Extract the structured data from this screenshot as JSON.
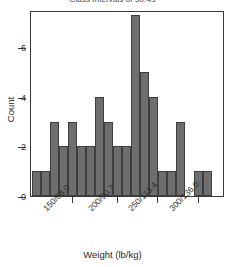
{
  "chart_data": {
    "type": "bar",
    "title": "Class Intervals of 30.43",
    "xlabel": "Weight (lb/kg)",
    "ylabel": "Count",
    "grid": false,
    "legend": null,
    "ylim": [
      0,
      7.5
    ],
    "yticks": [
      0,
      2,
      4,
      6
    ],
    "ytick_labels": [
      "0",
      "2",
      "4",
      "6"
    ],
    "xtick_labels": [
      "150/68.0",
      "200/90.7",
      "250/113.4",
      "300/136.0"
    ],
    "xtick_positions": [
      72,
      117,
      157,
      198
    ],
    "bar_width_px": 9,
    "bar_start_px": 31,
    "categories": [
      "b1",
      "b2",
      "b3",
      "b4",
      "b5",
      "b6",
      "b7",
      "b8",
      "b9",
      "b10",
      "b11",
      "b12",
      "b13",
      "b14",
      "b15",
      "b16",
      "b17",
      "b18",
      "b19",
      "b20"
    ],
    "values": [
      1,
      1,
      3,
      2,
      3,
      2,
      2,
      4,
      3,
      2,
      2,
      7.3,
      5,
      4,
      1,
      1,
      3,
      0,
      1,
      1
    ]
  },
  "colors": {
    "bar_fill": "#6e6e6e",
    "bar_edge": "#3f3f3f",
    "axis": "#3a3a3a",
    "text": "#2b2b2b",
    "title": "#4a4a4a",
    "background": "#ffffff"
  }
}
